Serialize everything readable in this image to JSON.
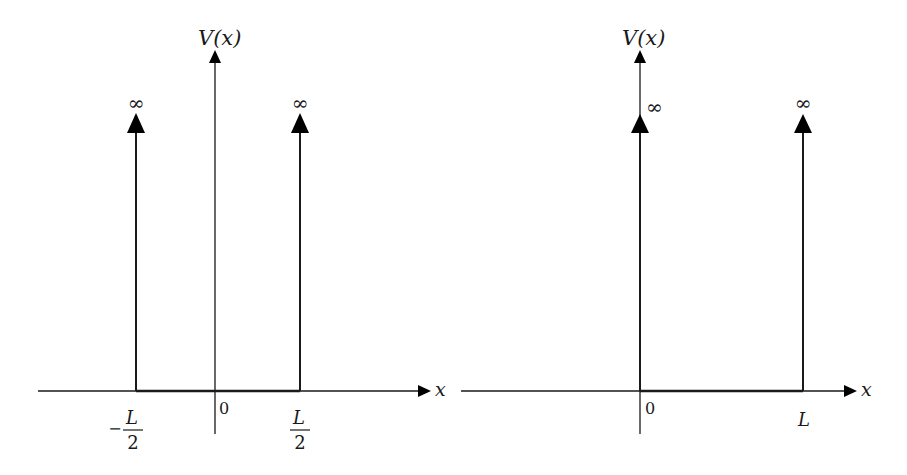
{
  "figure": {
    "colors": {
      "ink": "#1a1a1a",
      "background": "#ffffff"
    }
  },
  "panels": [
    {
      "id": "symmetric-well",
      "y_axis_label": "V(x)",
      "x_axis_label": "x",
      "origin_label": "0",
      "walls": [
        {
          "position": "-L/2",
          "label_sign": "−",
          "label_num": "L",
          "label_den": "2",
          "height_label": "∞"
        },
        {
          "position": "L/2",
          "label_sign": "",
          "label_num": "L",
          "label_den": "2",
          "height_label": "∞"
        }
      ]
    },
    {
      "id": "asymmetric-well",
      "y_axis_label": "V(x)",
      "x_axis_label": "x",
      "origin_label": "0",
      "walls": [
        {
          "position": "0",
          "label": "",
          "height_label": "∞"
        },
        {
          "position": "L",
          "label": "L",
          "height_label": "∞"
        }
      ]
    }
  ]
}
